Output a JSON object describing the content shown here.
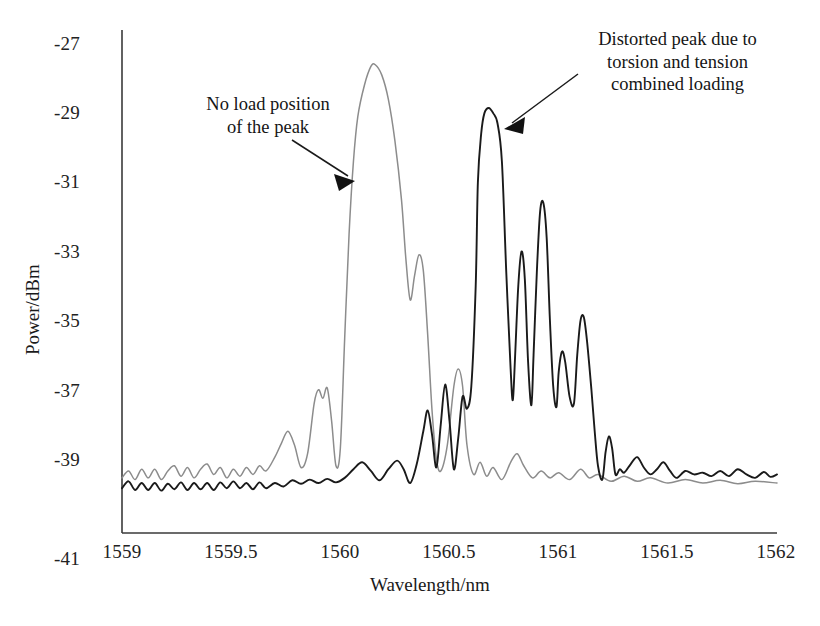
{
  "chart_data": {
    "type": "line",
    "title": "",
    "xlabel": "Wavelength/nm",
    "ylabel": "Power/dBm",
    "xlim": [
      1559,
      1562
    ],
    "ylim": [
      -41,
      -27
    ],
    "xticks": [
      "1559",
      "1559.5",
      "1560",
      "1560.5",
      "1561",
      "1561.5",
      "1562"
    ],
    "xtick_values": [
      1559,
      1559.5,
      1560,
      1560.5,
      1561,
      1561.5,
      1562
    ],
    "yticks": [
      "-27",
      "-29",
      "-31",
      "-33",
      "-35",
      "-37",
      "-39",
      "-41"
    ],
    "ytick_values": [
      -27,
      -29,
      -31,
      -33,
      -35,
      -37,
      -39,
      -41
    ],
    "grid": false,
    "legend": "none",
    "series": [
      {
        "name": "No load spectrum",
        "color": "#8c8c8c",
        "peak_wavelength": 1560.15,
        "peak_power": -27.6,
        "points": [
          [
            1559.0,
            -39.55
          ],
          [
            1559.03,
            -39.35
          ],
          [
            1559.06,
            -39.6
          ],
          [
            1559.09,
            -39.3
          ],
          [
            1559.12,
            -39.55
          ],
          [
            1559.15,
            -39.3
          ],
          [
            1559.18,
            -39.6
          ],
          [
            1559.21,
            -39.35
          ],
          [
            1559.24,
            -39.2
          ],
          [
            1559.27,
            -39.5
          ],
          [
            1559.3,
            -39.25
          ],
          [
            1559.33,
            -39.55
          ],
          [
            1559.36,
            -39.3
          ],
          [
            1559.39,
            -39.15
          ],
          [
            1559.42,
            -39.45
          ],
          [
            1559.45,
            -39.25
          ],
          [
            1559.48,
            -39.55
          ],
          [
            1559.51,
            -39.3
          ],
          [
            1559.54,
            -39.5
          ],
          [
            1559.57,
            -39.25
          ],
          [
            1559.6,
            -39.45
          ],
          [
            1559.63,
            -39.2
          ],
          [
            1559.66,
            -39.35
          ],
          [
            1559.7,
            -38.95
          ],
          [
            1559.73,
            -38.55
          ],
          [
            1559.76,
            -38.2
          ],
          [
            1559.79,
            -38.6
          ],
          [
            1559.82,
            -39.25
          ],
          [
            1559.85,
            -38.85
          ],
          [
            1559.88,
            -37.4
          ],
          [
            1559.9,
            -37.0
          ],
          [
            1559.92,
            -37.25
          ],
          [
            1559.94,
            -36.95
          ],
          [
            1559.96,
            -37.9
          ],
          [
            1559.98,
            -39.2
          ],
          [
            1560.0,
            -38.7
          ],
          [
            1560.02,
            -35.5
          ],
          [
            1560.04,
            -32.5
          ],
          [
            1560.06,
            -30.4
          ],
          [
            1560.08,
            -29.1
          ],
          [
            1560.11,
            -28.2
          ],
          [
            1560.14,
            -27.65
          ],
          [
            1560.16,
            -27.6
          ],
          [
            1560.19,
            -27.9
          ],
          [
            1560.22,
            -28.6
          ],
          [
            1560.25,
            -29.8
          ],
          [
            1560.28,
            -31.5
          ],
          [
            1560.3,
            -33.2
          ],
          [
            1560.32,
            -34.4
          ],
          [
            1560.34,
            -33.7
          ],
          [
            1560.36,
            -33.1
          ],
          [
            1560.38,
            -33.55
          ],
          [
            1560.4,
            -35.4
          ],
          [
            1560.42,
            -37.6
          ],
          [
            1560.44,
            -39.0
          ],
          [
            1560.46,
            -39.35
          ],
          [
            1560.49,
            -38.6
          ],
          [
            1560.52,
            -36.9
          ],
          [
            1560.54,
            -36.4
          ],
          [
            1560.56,
            -36.9
          ],
          [
            1560.58,
            -38.6
          ],
          [
            1560.61,
            -39.45
          ],
          [
            1560.64,
            -39.1
          ],
          [
            1560.67,
            -39.5
          ],
          [
            1560.7,
            -39.25
          ],
          [
            1560.74,
            -39.6
          ],
          [
            1560.78,
            -39.1
          ],
          [
            1560.81,
            -38.85
          ],
          [
            1560.84,
            -39.2
          ],
          [
            1560.88,
            -39.55
          ],
          [
            1560.92,
            -39.35
          ],
          [
            1560.96,
            -39.55
          ],
          [
            1561.0,
            -39.4
          ],
          [
            1561.05,
            -39.6
          ],
          [
            1561.1,
            -39.3
          ],
          [
            1561.14,
            -39.55
          ],
          [
            1561.18,
            -39.45
          ],
          [
            1561.24,
            -39.65
          ],
          [
            1561.3,
            -39.5
          ],
          [
            1561.36,
            -39.65
          ],
          [
            1561.42,
            -39.55
          ],
          [
            1561.5,
            -39.7
          ],
          [
            1561.58,
            -39.6
          ],
          [
            1561.66,
            -39.7
          ],
          [
            1561.74,
            -39.62
          ],
          [
            1561.82,
            -39.72
          ],
          [
            1561.9,
            -39.65
          ],
          [
            1562.0,
            -39.7
          ]
        ]
      },
      {
        "name": "Torsion and tension combined loading spectrum",
        "color": "#1a1a1a",
        "peak_wavelength": 1560.68,
        "peak_power": -28.85,
        "points": [
          [
            1559.0,
            -39.85
          ],
          [
            1559.03,
            -39.65
          ],
          [
            1559.06,
            -39.9
          ],
          [
            1559.09,
            -39.7
          ],
          [
            1559.12,
            -39.9
          ],
          [
            1559.15,
            -39.7
          ],
          [
            1559.18,
            -39.92
          ],
          [
            1559.21,
            -39.72
          ],
          [
            1559.24,
            -39.88
          ],
          [
            1559.27,
            -39.68
          ],
          [
            1559.3,
            -39.9
          ],
          [
            1559.33,
            -39.7
          ],
          [
            1559.36,
            -39.88
          ],
          [
            1559.39,
            -39.7
          ],
          [
            1559.42,
            -39.9
          ],
          [
            1559.45,
            -39.68
          ],
          [
            1559.48,
            -39.85
          ],
          [
            1559.51,
            -39.65
          ],
          [
            1559.54,
            -39.85
          ],
          [
            1559.57,
            -39.7
          ],
          [
            1559.6,
            -39.88
          ],
          [
            1559.63,
            -39.68
          ],
          [
            1559.66,
            -39.85
          ],
          [
            1559.7,
            -39.7
          ],
          [
            1559.74,
            -39.8
          ],
          [
            1559.78,
            -39.62
          ],
          [
            1559.82,
            -39.72
          ],
          [
            1559.86,
            -39.6
          ],
          [
            1559.9,
            -39.7
          ],
          [
            1559.94,
            -39.58
          ],
          [
            1559.98,
            -39.68
          ],
          [
            1560.02,
            -39.55
          ],
          [
            1560.06,
            -39.3
          ],
          [
            1560.1,
            -39.1
          ],
          [
            1560.14,
            -39.35
          ],
          [
            1560.18,
            -39.62
          ],
          [
            1560.22,
            -39.3
          ],
          [
            1560.26,
            -39.05
          ],
          [
            1560.29,
            -39.3
          ],
          [
            1560.32,
            -39.7
          ],
          [
            1560.35,
            -39.15
          ],
          [
            1560.38,
            -38.2
          ],
          [
            1560.4,
            -37.6
          ],
          [
            1560.42,
            -38.3
          ],
          [
            1560.44,
            -39.25
          ],
          [
            1560.46,
            -38.0
          ],
          [
            1560.48,
            -36.85
          ],
          [
            1560.5,
            -37.9
          ],
          [
            1560.52,
            -39.3
          ],
          [
            1560.54,
            -38.4
          ],
          [
            1560.56,
            -37.2
          ],
          [
            1560.58,
            -37.55
          ],
          [
            1560.6,
            -36.9
          ],
          [
            1560.62,
            -34.0
          ],
          [
            1560.63,
            -31.0
          ],
          [
            1560.645,
            -29.6
          ],
          [
            1560.66,
            -29.0
          ],
          [
            1560.68,
            -28.85
          ],
          [
            1560.7,
            -29.0
          ],
          [
            1560.72,
            -29.3
          ],
          [
            1560.74,
            -30.4
          ],
          [
            1560.76,
            -33.6
          ],
          [
            1560.78,
            -36.4
          ],
          [
            1560.79,
            -37.3
          ],
          [
            1560.8,
            -36.1
          ],
          [
            1560.815,
            -34.0
          ],
          [
            1560.83,
            -33.0
          ],
          [
            1560.845,
            -33.8
          ],
          [
            1560.86,
            -36.2
          ],
          [
            1560.875,
            -37.45
          ],
          [
            1560.885,
            -36.0
          ],
          [
            1560.9,
            -33.6
          ],
          [
            1560.915,
            -31.85
          ],
          [
            1560.93,
            -31.6
          ],
          [
            1560.945,
            -32.6
          ],
          [
            1560.96,
            -35.0
          ],
          [
            1560.975,
            -36.9
          ],
          [
            1560.99,
            -37.5
          ],
          [
            1561.0,
            -36.5
          ],
          [
            1561.015,
            -35.9
          ],
          [
            1561.03,
            -36.2
          ],
          [
            1561.05,
            -37.2
          ],
          [
            1561.07,
            -37.4
          ],
          [
            1561.085,
            -36.0
          ],
          [
            1561.1,
            -35.0
          ],
          [
            1561.115,
            -34.9
          ],
          [
            1561.13,
            -35.6
          ],
          [
            1561.15,
            -37.0
          ],
          [
            1561.165,
            -38.2
          ],
          [
            1561.18,
            -39.2
          ],
          [
            1561.2,
            -39.6
          ],
          [
            1561.215,
            -38.8
          ],
          [
            1561.23,
            -38.35
          ],
          [
            1561.245,
            -38.7
          ],
          [
            1561.26,
            -39.45
          ],
          [
            1561.28,
            -39.3
          ],
          [
            1561.3,
            -39.4
          ],
          [
            1561.33,
            -39.15
          ],
          [
            1561.36,
            -38.95
          ],
          [
            1561.39,
            -39.25
          ],
          [
            1561.42,
            -39.45
          ],
          [
            1561.45,
            -39.3
          ],
          [
            1561.48,
            -39.1
          ],
          [
            1561.51,
            -39.35
          ],
          [
            1561.54,
            -39.55
          ],
          [
            1561.58,
            -39.35
          ],
          [
            1561.62,
            -39.45
          ],
          [
            1561.66,
            -39.4
          ],
          [
            1561.7,
            -39.5
          ],
          [
            1561.74,
            -39.35
          ],
          [
            1561.78,
            -39.5
          ],
          [
            1561.82,
            -39.3
          ],
          [
            1561.86,
            -39.45
          ],
          [
            1561.9,
            -39.55
          ],
          [
            1561.94,
            -39.38
          ],
          [
            1561.97,
            -39.52
          ],
          [
            1562.0,
            -39.45
          ]
        ]
      }
    ],
    "annotations": [
      {
        "id": "no-load-annotation",
        "text": "No load position\nof the peak",
        "target_wavelength": 1560.04,
        "target_power": -31.3
      },
      {
        "id": "distorted-peak-annotation",
        "text": "Distorted peak due to\ntorsion and tension\ncombined loading",
        "target_wavelength": 1560.72,
        "target_power": -29.2
      }
    ]
  },
  "axes": {
    "x_title": "Wavelength/nm",
    "y_title": "Power/dBm",
    "x_tick_labels": [
      "1559",
      "1559.5",
      "1560",
      "1560.5",
      "1561",
      "1561.5",
      "1562"
    ],
    "y_tick_labels": [
      "-27",
      "-29",
      "-31",
      "-33",
      "-35",
      "-37",
      "-39",
      "-41"
    ]
  },
  "annotations": {
    "left": "No load position\nof the peak",
    "right": "Distorted peak due to\ntorsion and tension\ncombined loading"
  },
  "colors": {
    "no_load_curve": "#8c8c8c",
    "loaded_curve": "#1a1a1a",
    "axis": "#3a3a3a",
    "background": "#ffffff"
  }
}
